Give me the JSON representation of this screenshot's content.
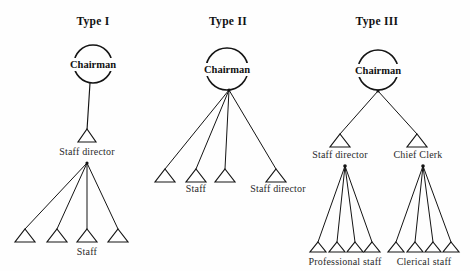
{
  "figure": {
    "background_color": "#fefefe",
    "ink_color": "#141414",
    "width": 470,
    "height": 271
  },
  "panels": [
    {
      "id": "type-1",
      "title": "Type I",
      "title_x": 93,
      "title_y": 25,
      "root": {
        "label": "Chairman",
        "cx": 93,
        "cy": 64,
        "r": 19
      },
      "nodes": [
        {
          "name": "staff-director",
          "label": "Staff director",
          "x": 87,
          "y": 136,
          "label_x": 87,
          "label_y": 152
        },
        {
          "name": "staff",
          "label": "Staff",
          "x": 87,
          "y": 230,
          "label_x": 87,
          "label_y": 253
        }
      ],
      "leaves_x": [
        25,
        57,
        87,
        118
      ],
      "leaf_y": 230,
      "fan_apex": {
        "x": 87,
        "y": 163
      }
    },
    {
      "id": "type-2",
      "title": "Type II",
      "title_x": 228,
      "title_y": 25,
      "root": {
        "label": "Chairman",
        "cx": 227,
        "cy": 69,
        "r": 21
      },
      "nodes": [
        {
          "name": "staff",
          "label": "Staff",
          "label_x": 196,
          "label_y": 186
        },
        {
          "name": "staff-director",
          "label": "Staff director",
          "label_x": 276,
          "label_y": 186
        }
      ],
      "leaves_x": [
        165,
        196,
        225,
        276
      ],
      "leaf_y": 170,
      "fan_apex": {
        "x": 229,
        "y": 90
      }
    },
    {
      "id": "type-3",
      "title": "Type III",
      "title_x": 377,
      "title_y": 25,
      "root": {
        "label": "Chairman",
        "cx": 378,
        "cy": 70,
        "r": 20
      },
      "nodes": [
        {
          "name": "staff-director",
          "label": "Staff director",
          "x": 340,
          "y": 135,
          "label_x": 340,
          "label_y": 152
        },
        {
          "name": "chief-clerk",
          "label": "Chief Clerk",
          "x": 417,
          "y": 135,
          "label_x": 418,
          "label_y": 152
        },
        {
          "name": "professional-staff",
          "label": "Professional staff",
          "label_x": 345,
          "label_y": 262
        },
        {
          "name": "clerical-staff",
          "label": "Clerical staff",
          "label_x": 424,
          "label_y": 262
        }
      ],
      "fan_apex": {
        "x": 378,
        "y": 91
      },
      "subtrees": [
        {
          "name": "professional-staff-subtree",
          "apex": {
            "x": 345,
            "y": 166
          },
          "leaves_x": [
            318,
            337,
            355,
            372
          ],
          "leaf_y": 243
        },
        {
          "name": "clerical-staff-subtree",
          "apex": {
            "x": 423,
            "y": 166
          },
          "leaves_x": [
            396,
            415,
            433,
            451
          ],
          "leaf_y": 243
        }
      ]
    }
  ],
  "labels": {
    "chairman": "Chairman",
    "staff": "Staff",
    "staff_director": "Staff director",
    "chief_clerk": "Chief Clerk",
    "professional_staff": "Professional staff",
    "clerical_staff": "Clerical staff",
    "type_1": "Type I",
    "type_2": "Type II",
    "type_3": "Type III"
  }
}
